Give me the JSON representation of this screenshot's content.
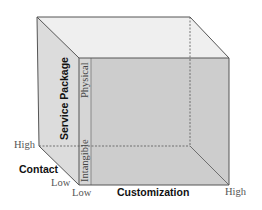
{
  "diagram": {
    "type": "3d-cube",
    "axes": {
      "vertical": {
        "title": "Service Package",
        "low_label": "Intangible",
        "high_label": "Physical"
      },
      "depth": {
        "title": "Contact",
        "high_label": "High",
        "low_label": "Low"
      },
      "horizontal": {
        "title": "Customization",
        "low_label": "Low",
        "high_label": "High"
      }
    },
    "colors": {
      "front_face": "#cfcfcf",
      "left_face": "#dedede",
      "top_face": "#efefef",
      "edge": "#555555"
    }
  }
}
